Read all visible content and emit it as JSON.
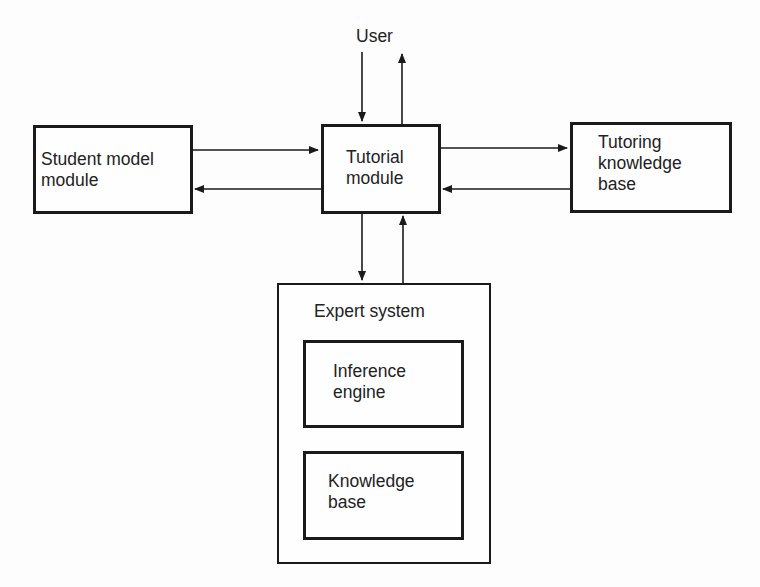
{
  "diagram": {
    "type": "block-diagram",
    "title": "",
    "external": {
      "user": {
        "label": "User"
      }
    },
    "nodes": {
      "student_model": {
        "label": "Student model\nmodule"
      },
      "tutorial": {
        "label": "Tutorial\nmodule"
      },
      "tutoring_kb": {
        "label": "Tutoring\nknowledge\nbase"
      },
      "expert_system": {
        "label": "Expert system",
        "children": {
          "inference_engine": {
            "label": "Inference\nengine"
          },
          "knowledge_base": {
            "label": "Knowledge\nbase"
          }
        }
      }
    },
    "edges": [
      {
        "from": "User",
        "to": "Tutorial module"
      },
      {
        "from": "Tutorial module",
        "to": "User"
      },
      {
        "from": "Student model module",
        "to": "Tutorial module"
      },
      {
        "from": "Tutorial module",
        "to": "Student model module"
      },
      {
        "from": "Tutorial module",
        "to": "Tutoring knowledge base"
      },
      {
        "from": "Tutoring knowledge base",
        "to": "Tutorial module"
      },
      {
        "from": "Tutorial module",
        "to": "Expert system"
      },
      {
        "from": "Expert system",
        "to": "Tutorial module"
      }
    ],
    "colors": {
      "line": "#1a1a1a",
      "background": "#fdfdfd",
      "text": "#222222"
    }
  }
}
